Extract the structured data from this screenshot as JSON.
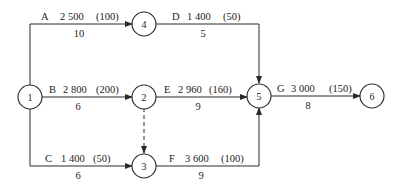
{
  "diagram": {
    "type": "activity-on-arrow network",
    "nodes": [
      {
        "id": "1",
        "label": "1"
      },
      {
        "id": "2",
        "label": "2"
      },
      {
        "id": "3",
        "label": "3"
      },
      {
        "id": "4",
        "label": "4"
      },
      {
        "id": "5",
        "label": "5"
      },
      {
        "id": "6",
        "label": "6"
      }
    ],
    "activities": [
      {
        "name": "A",
        "cost": "2 500",
        "crash": "(100)",
        "duration": "10",
        "from": "1",
        "to": "4"
      },
      {
        "name": "B",
        "cost": "2 800",
        "crash": "(200)",
        "duration": "6",
        "from": "1",
        "to": "2"
      },
      {
        "name": "C",
        "cost": "1 400",
        "crash": "(50)",
        "duration": "6",
        "from": "1",
        "to": "3"
      },
      {
        "name": "D",
        "cost": "1 400",
        "crash": "(50)",
        "duration": "5",
        "from": "4",
        "to": "5"
      },
      {
        "name": "E",
        "cost": "2 960",
        "crash": "(160)",
        "duration": "9",
        "from": "2",
        "to": "5"
      },
      {
        "name": "F",
        "cost": "3 600",
        "crash": "(100)",
        "duration": "9",
        "from": "3",
        "to": "5"
      },
      {
        "name": "G",
        "cost": "3 000",
        "crash": "(150)",
        "duration": "8",
        "from": "5",
        "to": "6"
      }
    ],
    "dummy": {
      "from": "2",
      "to": "3",
      "style": "dashed"
    }
  }
}
